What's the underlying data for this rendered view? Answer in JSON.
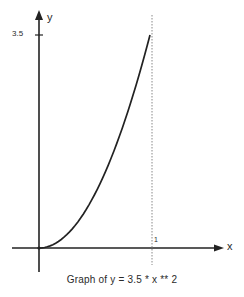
{
  "chart_data": {
    "type": "line",
    "title": "Graph of y = 3.5 * x ** 2",
    "xlabel": "x",
    "ylabel": "y",
    "x_ticks": [
      "1"
    ],
    "y_ticks": [
      "3.5"
    ],
    "xlim": [
      -0.25,
      1.65
    ],
    "ylim": [
      0,
      3.5
    ],
    "grid": false,
    "legend": null,
    "annotations": [
      "dashed vertical line at x = 1"
    ],
    "series": [
      {
        "name": "y = 3.5 * x ** 2",
        "x": [
          0,
          0.1,
          0.2,
          0.3,
          0.4,
          0.5,
          0.6,
          0.7,
          0.8,
          0.9,
          1.0
        ],
        "y": [
          0,
          0.035,
          0.14,
          0.315,
          0.56,
          0.875,
          1.26,
          1.715,
          2.24,
          2.835,
          3.5
        ]
      }
    ],
    "colors": {
      "ink": "#222222",
      "dashed": "#888888",
      "background": "#ffffff"
    }
  },
  "labels": {
    "y_axis": "y",
    "x_axis": "x",
    "y_tick": "3.5",
    "x_tick": "1",
    "caption": "Graph of y = 3.5 * x ** 2"
  }
}
